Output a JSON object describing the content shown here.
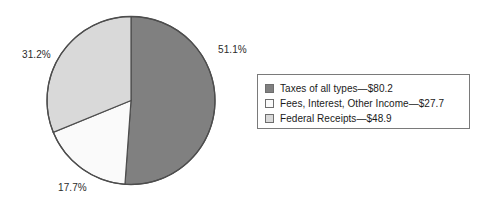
{
  "chart_data": {
    "type": "pie",
    "title": "",
    "subtitle": "",
    "xlabel": "",
    "ylabel": "",
    "legend_position": "right",
    "grid": false,
    "units": "billions of dollars",
    "start_angle_deg": 0,
    "direction": "clockwise",
    "categories": [
      "Taxes of all types",
      "Fees, Interest, Other Income",
      "Federal Receipts"
    ],
    "values": [
      80.2,
      27.7,
      48.9
    ],
    "percents": [
      51.1,
      17.7,
      31.2
    ],
    "colors": [
      "#808080",
      "#fafafa",
      "#d9d9d9"
    ],
    "slices": [
      {
        "label": "Taxes of all types",
        "value": 80.2,
        "percent": 51.1,
        "percent_text": "51.1%",
        "amount_text": "$80.2",
        "legend_text": "Taxes of all types—$80.2",
        "color": "#808080"
      },
      {
        "label": "Fees, Interest, Other Income",
        "value": 27.7,
        "percent": 17.7,
        "percent_text": "17.7%",
        "amount_text": "$27.7",
        "legend_text": "Fees, Interest, Other Income—$27.7",
        "color": "#fafafa"
      },
      {
        "label": "Federal Receipts",
        "value": 48.9,
        "percent": 31.2,
        "percent_text": "31.2%",
        "amount_text": "$48.9",
        "legend_text": "Federal Receipts—$48.9",
        "color": "#d9d9d9"
      }
    ]
  },
  "legend": {
    "items": [
      {
        "swatch_color": "#808080",
        "text": "Taxes of all types—$80.2"
      },
      {
        "swatch_color": "#fafafa",
        "text": "Fees, Interest, Other Income—$27.7"
      },
      {
        "swatch_color": "#d9d9d9",
        "text": "Federal Receipts—$48.9"
      }
    ],
    "border_color": "#7a7a7a"
  },
  "labels": {
    "taxes_pct": "51.1%",
    "fees_pct": "17.7%",
    "federal_pct": "31.2%"
  },
  "style": {
    "background": "#ffffff",
    "outline_color": "#4d4d4d"
  }
}
